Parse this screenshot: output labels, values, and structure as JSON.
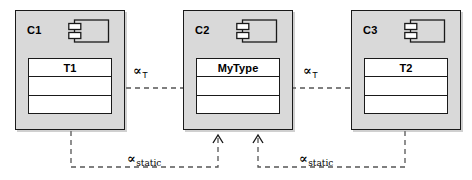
{
  "diagram": {
    "type": "uml-component-dependency",
    "background_color": "#ffffff",
    "component_fill": "#d9d9d9",
    "class_fill": "#ffffff",
    "line_color": "#1a1a1a",
    "edge_color": "#555555"
  },
  "components": [
    {
      "id": "c1",
      "label": "C1",
      "icon": "uml-component-icon",
      "class": {
        "name": "T1",
        "compartment_count": 3,
        "compartments": [
          "T1",
          "",
          ""
        ]
      }
    },
    {
      "id": "c2",
      "label": "C2",
      "icon": "uml-component-icon",
      "class": {
        "name": "MyType",
        "compartment_count": 3,
        "compartments": [
          "MyType",
          "",
          ""
        ]
      }
    },
    {
      "id": "c3",
      "label": "C3",
      "icon": "uml-component-icon",
      "class": {
        "name": "T2",
        "compartment_count": 3,
        "compartments": [
          "T2",
          "",
          ""
        ]
      }
    }
  ],
  "edges": [
    {
      "id": "edge-t-left",
      "from": "c1.T1",
      "to": "c2.MyType",
      "style": "dashed",
      "arrowhead": "open",
      "symbol": "∝",
      "subscript": "T",
      "label_text": "∝T"
    },
    {
      "id": "edge-t-right",
      "from": "c3.T2",
      "to": "c2.MyType",
      "style": "dashed",
      "arrowhead": "open",
      "symbol": "∝",
      "subscript": "T",
      "label_text": "∝T"
    },
    {
      "id": "edge-static-left",
      "from": "c1",
      "to": "c2",
      "style": "dashed",
      "arrowhead": "open-up",
      "symbol": "∝",
      "subscript": "static",
      "label_text": "∝static"
    },
    {
      "id": "edge-static-right",
      "from": "c3",
      "to": "c2",
      "style": "dashed",
      "arrowhead": "open-up",
      "symbol": "∝",
      "subscript": "static",
      "label_text": "∝static"
    }
  ]
}
